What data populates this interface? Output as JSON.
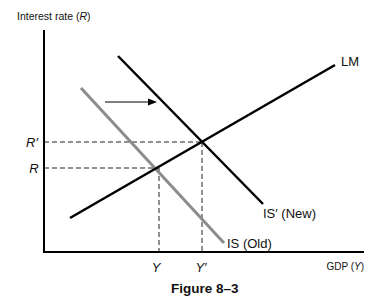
{
  "diagram": {
    "y_axis_label_text": "Interest rate",
    "y_axis_label_var": "R",
    "x_axis_label_text": "GDP",
    "x_axis_label_var": "Y",
    "caption": "Figure 8–3",
    "curves": {
      "lm": "LM",
      "is_new": "IS′ (New)",
      "is_old": "IS (Old)"
    },
    "y_ticks": {
      "r_prime": "R′",
      "r": "R"
    },
    "x_ticks": {
      "y": "Y",
      "y_prime": "Y′"
    },
    "colors": {
      "is_old": "#8c8c8c",
      "lines": "#000000"
    },
    "shift_arrow": "right"
  }
}
